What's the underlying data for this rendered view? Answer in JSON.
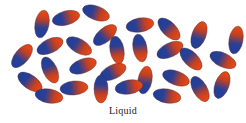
{
  "diagram": {
    "caption": "Liquid",
    "colors": {
      "blue": "#1f3f9a",
      "red": "#e0401a",
      "stroke": "#5a2a2a"
    },
    "molecule": {
      "rx": 14,
      "ry": 7
    },
    "molecules": [
      {
        "x": 42,
        "y": 24,
        "a": -80
      },
      {
        "x": 66,
        "y": 18,
        "a": -15
      },
      {
        "x": 96,
        "y": 13,
        "a": 20
      },
      {
        "x": 105,
        "y": 35,
        "a": -40
      },
      {
        "x": 117,
        "y": 50,
        "a": 80
      },
      {
        "x": 79,
        "y": 46,
        "a": 30
      },
      {
        "x": 50,
        "y": 46,
        "a": -25
      },
      {
        "x": 22,
        "y": 56,
        "a": -50
      },
      {
        "x": 50,
        "y": 70,
        "a": 65
      },
      {
        "x": 83,
        "y": 66,
        "a": -20
      },
      {
        "x": 113,
        "y": 72,
        "a": -25
      },
      {
        "x": 30,
        "y": 82,
        "a": 35
      },
      {
        "x": 74,
        "y": 88,
        "a": -5
      },
      {
        "x": 49,
        "y": 96,
        "a": 10
      },
      {
        "x": 140,
        "y": 25,
        "a": -10
      },
      {
        "x": 169,
        "y": 29,
        "a": 45
      },
      {
        "x": 140,
        "y": 48,
        "a": 80
      },
      {
        "x": 170,
        "y": 50,
        "a": -25
      },
      {
        "x": 199,
        "y": 35,
        "a": -70
      },
      {
        "x": 191,
        "y": 59,
        "a": 45
      },
      {
        "x": 223,
        "y": 60,
        "a": 25
      },
      {
        "x": 145,
        "y": 80,
        "a": -80
      },
      {
        "x": 176,
        "y": 78,
        "a": 20
      },
      {
        "x": 129,
        "y": 87,
        "a": -10
      },
      {
        "x": 167,
        "y": 96,
        "a": 10
      },
      {
        "x": 200,
        "y": 89,
        "a": 60
      },
      {
        "x": 222,
        "y": 85,
        "a": -70
      },
      {
        "x": 236,
        "y": 40,
        "a": -80
      },
      {
        "x": 101,
        "y": 89,
        "a": 90
      }
    ]
  }
}
